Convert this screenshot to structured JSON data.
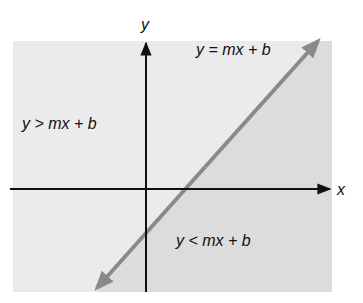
{
  "diagram": {
    "axes": {
      "x_label": "x",
      "y_label": "y"
    },
    "labels": {
      "line": "y = mx + b",
      "above": "y > mx + b",
      "below": "y < mx + b"
    },
    "colors": {
      "background": "#ffffff",
      "upper_region": "#ebebeb",
      "lower_region": "#dcdcdc",
      "line": "#8a8a8a",
      "axes": "#111111"
    }
  }
}
